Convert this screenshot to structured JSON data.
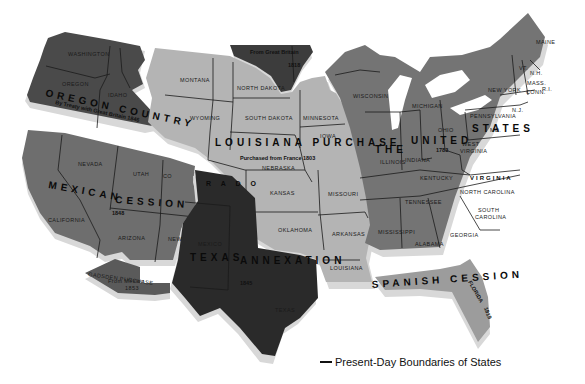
{
  "map": {
    "title": "Territorial Growth of the United States",
    "colors": {
      "oregon_country": "#4a4a4a",
      "mexican_cession": "#6e6e6e",
      "louisiana_purchase": "#b4b4b4",
      "united_states_1783": "#747474",
      "texas_annexation": "#2a2a2a",
      "great_britain_1818": "#3c3c3c",
      "spanish_cession": "#9c9c9c",
      "gadsden_purchase": "#5a5a5a",
      "shadow": "#d8d8d8",
      "border": "#1a1a1a"
    },
    "regions": {
      "oregon": {
        "name": "OREGON COUNTRY",
        "note": "By Treaty with Great Britain 1846"
      },
      "great_britain": {
        "note": "From Great Britain",
        "year": "1818"
      },
      "louisiana": {
        "name": "LOUISIANA PURCHASE",
        "note": "Purchased from France 1803"
      },
      "mexican": {
        "name1": "MEXICAN",
        "name2": "CESSION",
        "year": "1848"
      },
      "texas": {
        "name1": "TEXAS",
        "name2": "ANNEXATION",
        "year": "1845"
      },
      "united_states": {
        "name1": "THE",
        "name2": "UNITED",
        "name3": "STATES",
        "year": "1783"
      },
      "spanish": {
        "name": "SPANISH CESSION",
        "note": "FLORIDA",
        "year": "1819"
      },
      "gadsden": {
        "name": "GADSDEN PURCHASE",
        "note": "From Mexico",
        "year": "1853"
      }
    },
    "states": {
      "washington": "WASHINGTON",
      "oregon": "OREGON",
      "idaho": "IDAHO",
      "montana": "MONTANA",
      "wyoming": "WYOMING",
      "north_dakota": "NORTH DAKOTA",
      "south_dakota": "SOUTH DAKOTA",
      "minnesota": "MINNESOTA",
      "iowa": "IOWA",
      "nebraska": "NEBRASKA",
      "colorado_part1": "CO",
      "colorado_part2": "R A D O",
      "kansas": "KANSAS",
      "missouri": "MISSOURI",
      "oklahoma": "OKLAHOMA",
      "arkansas": "ARKANSAS",
      "louisiana": "LOUISIANA",
      "nevada": "NEVADA",
      "utah": "UTAH",
      "california": "CALIFORNIA",
      "arizona": "ARIZONA",
      "new_mexico_west": "NEW",
      "new_mexico_east": "MEXICO",
      "texas": "TEXAS",
      "wisconsin": "WISCONSIN",
      "michigan": "MICHIGAN",
      "illinois": "ILLINOIS",
      "indiana": "INDIANA",
      "ohio": "OHIO",
      "kentucky": "KENTUCKY",
      "tennessee": "TENNESSEE",
      "mississippi": "MISSISSIPPI",
      "alabama": "ALABAMA",
      "georgia": "GEORGIA",
      "south_carolina_1": "SOUTH",
      "south_carolina_2": "CAROLINA",
      "north_carolina": "NORTH CAROLINA",
      "virginia": "VIRGINIA",
      "west_virginia_1": "WEST",
      "west_virginia_2": "VIRGINIA",
      "pennsylvania": "PENNSYLVANIA",
      "new_york": "NEW YORK",
      "maine": "MAINE",
      "vermont": "VT.",
      "new_hampshire": "N.H.",
      "massachusetts": "MASS.",
      "connecticut": "CONN.",
      "rhode_island": "R.I.",
      "new_jersey": "N.J.",
      "maryland": "MD.",
      "delaware": "DEL."
    }
  },
  "legend": {
    "label": "Present-Day Boundaries of States"
  }
}
